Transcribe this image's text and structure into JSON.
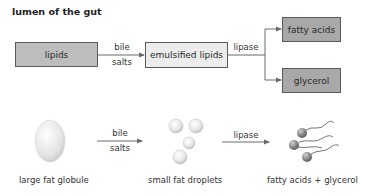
{
  "title": "lumen of the gut",
  "flow": {
    "boxes": {
      "lipids": "lipids",
      "emulsified": "emulsified lipids",
      "fatty_acids": "fatty acids",
      "glycerol": "glycerol"
    },
    "arrows": {
      "bile_top": "bile",
      "bile_bottom": "salts",
      "lipase": "lipase"
    }
  },
  "illustration": {
    "arrows": {
      "bile_top": "bile",
      "bile_bottom": "salts",
      "lipase": "lipase"
    },
    "captions": {
      "globule": "large fat globule",
      "droplets": "small fat droplets",
      "products": "fatty acids + glycerol"
    }
  },
  "colors": {
    "box_dark": "#bdbdbd",
    "box_light": "#ececec",
    "line": "#6a6a6a"
  }
}
